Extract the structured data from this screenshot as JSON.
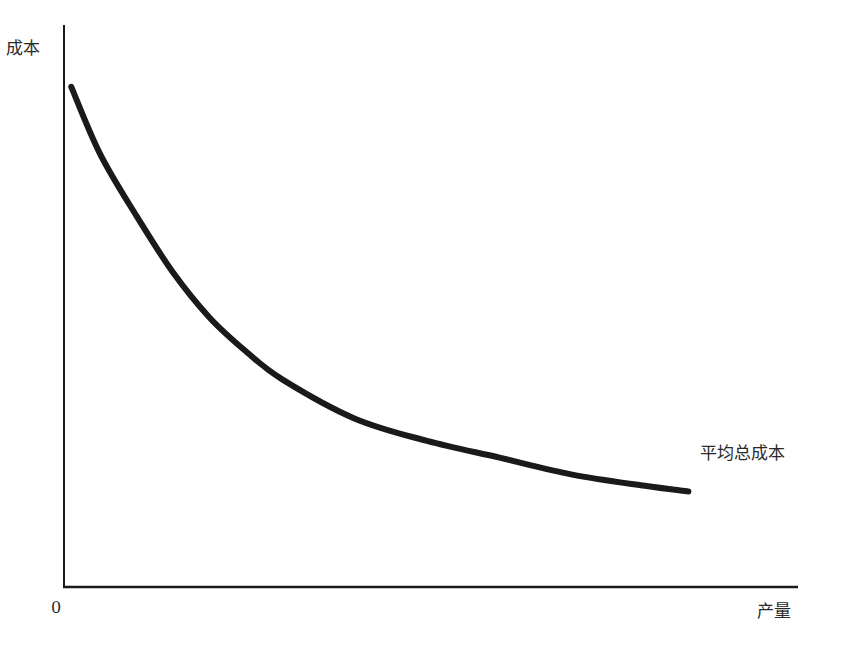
{
  "chart_data": {
    "type": "line",
    "title": "",
    "xlabel": "产量",
    "ylabel": "成本",
    "origin_label": "0",
    "grid": false,
    "legend": "none",
    "axis_ticks": "none",
    "xlim": [
      0,
      100
    ],
    "ylim": [
      0,
      100
    ],
    "series": [
      {
        "name": "平均总成本",
        "label_position": "right-end",
        "color": "#1a1a1a",
        "x": [
          1,
          5,
          10,
          15,
          20,
          25,
          30,
          40,
          50,
          60,
          70,
          80,
          86
        ],
        "values": [
          89,
          77,
          66,
          56,
          48,
          42,
          37,
          30,
          26,
          23,
          20,
          18,
          17
        ]
      }
    ]
  },
  "labels": {
    "y_axis": "成本",
    "x_axis": "产量",
    "origin": "0",
    "curve": "平均总成本"
  },
  "colors": {
    "axis": "#1a1a1a",
    "curve": "#1a1a1a",
    "text": "#2a2a2a",
    "background": "#ffffff"
  }
}
